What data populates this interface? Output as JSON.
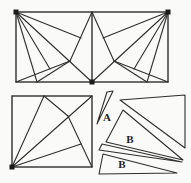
{
  "diagram": {
    "canvas": {
      "width": 191,
      "height": 183,
      "background": "#fafaf8"
    },
    "style": {
      "line_color": "#2e2e2e",
      "border_width": 1.4,
      "inner_width": 1.1,
      "dot_color": "#1c1c1c",
      "dot_size": 5,
      "label_color": "#1f1f1f",
      "label_font_size": 11
    },
    "top_rectangle": {
      "border": {
        "x1": 16,
        "y1": 12,
        "x2": 168,
        "y2": 82
      },
      "midline": {
        "x1": 92,
        "y1": 12,
        "x2": 92,
        "y2": 82
      },
      "segments": [
        {
          "name": "left-fan-steep",
          "x1": 16,
          "y1": 12,
          "x2": 37,
          "y2": 82
        },
        {
          "name": "left-fan-medium",
          "x1": 16,
          "y1": 12,
          "x2": 50,
          "y2": 69
        },
        {
          "name": "left-diagonal",
          "x1": 16,
          "y1": 12,
          "x2": 92,
          "y2": 82
        },
        {
          "name": "left-fan-shallow",
          "x1": 16,
          "y1": 12,
          "x2": 81,
          "y2": 38
        },
        {
          "name": "left-top-mid-to-node",
          "x1": 92,
          "y1": 12,
          "x2": 70,
          "y2": 61
        },
        {
          "name": "left-bl-to-node",
          "x1": 16,
          "y1": 82,
          "x2": 70,
          "y2": 61
        },
        {
          "name": "left-bottom-to-node",
          "x1": 37,
          "y1": 82,
          "x2": 70,
          "y2": 61
        },
        {
          "name": "right-fan-steep",
          "x1": 168,
          "y1": 12,
          "x2": 147,
          "y2": 82
        },
        {
          "name": "right-fan-medium",
          "x1": 168,
          "y1": 12,
          "x2": 134,
          "y2": 69
        },
        {
          "name": "right-diagonal",
          "x1": 168,
          "y1": 12,
          "x2": 92,
          "y2": 82
        },
        {
          "name": "right-fan-shallow",
          "x1": 168,
          "y1": 12,
          "x2": 103,
          "y2": 38
        },
        {
          "name": "right-top-mid-to-node",
          "x1": 92,
          "y1": 12,
          "x2": 114,
          "y2": 61
        },
        {
          "name": "right-br-to-node",
          "x1": 168,
          "y1": 82,
          "x2": 114,
          "y2": 61
        },
        {
          "name": "right-bottom-to-node",
          "x1": 147,
          "y1": 82,
          "x2": 114,
          "y2": 61
        }
      ]
    },
    "bottom_left_square": {
      "border": {
        "x1": 12,
        "y1": 96,
        "x2": 92,
        "y2": 167
      },
      "segments": [
        {
          "name": "square-diagonal",
          "x1": 12,
          "y1": 167,
          "x2": 92,
          "y2": 96
        },
        {
          "name": "square-fan-top",
          "x1": 12,
          "y1": 167,
          "x2": 44,
          "y2": 96
        },
        {
          "name": "square-top-to-node",
          "x1": 44,
          "y1": 96,
          "x2": 68,
          "y2": 116
        },
        {
          "name": "square-node-to-br",
          "x1": 68,
          "y1": 116,
          "x2": 92,
          "y2": 167
        },
        {
          "name": "square-fan-right",
          "x1": 12,
          "y1": 167,
          "x2": 81,
          "y2": 144
        }
      ]
    },
    "pieces": [
      {
        "name": "piece-sliver-a",
        "points": "107,92 113,91 97,124"
      },
      {
        "name": "piece-large-triangle",
        "points": "120,100 185,95 185,148"
      },
      {
        "name": "piece-b-middle",
        "points": "123,110 106,142 183,160"
      },
      {
        "name": "piece-sliver-thin",
        "points": "102,144 99,150 182,162"
      },
      {
        "name": "piece-b-bottom",
        "points": "103,154 99,174 177,173"
      }
    ],
    "labels": [
      {
        "name": "label-a",
        "text": "A",
        "x": 107,
        "y": 121
      },
      {
        "name": "label-b-middle",
        "text": "B",
        "x": 130,
        "y": 143
      },
      {
        "name": "label-b-bottom",
        "text": "B",
        "x": 122,
        "y": 168
      }
    ],
    "corner_dots": [
      {
        "name": "dot-rect-top-left",
        "x": 16,
        "y": 12
      },
      {
        "name": "dot-rect-top-right",
        "x": 168,
        "y": 12
      },
      {
        "name": "dot-rect-bottom-mid",
        "x": 92,
        "y": 82
      },
      {
        "name": "dot-square-bottom-left",
        "x": 12,
        "y": 167
      }
    ]
  }
}
